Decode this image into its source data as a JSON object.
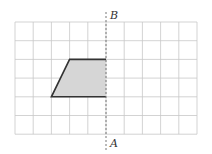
{
  "figure": {
    "type": "grid-reflection-diagram",
    "grid": {
      "columns": 10,
      "rows": 6,
      "line_color": "#c8c8c8"
    },
    "shape": {
      "name": "trapezoid",
      "vertices_grid": [
        [
          3,
          2
        ],
        [
          5,
          2
        ],
        [
          5,
          4
        ],
        [
          2,
          4
        ]
      ],
      "fill": "#d6d6d6",
      "stroke": "#333333"
    },
    "axis_line": {
      "style": "dashed",
      "grid_x": 5,
      "color": "#777777"
    },
    "labels": {
      "top": "B",
      "bottom": "A"
    }
  }
}
